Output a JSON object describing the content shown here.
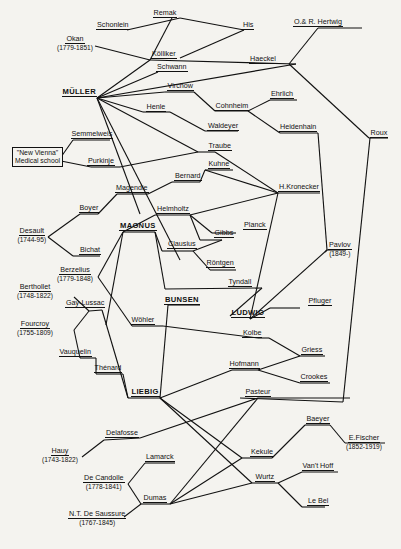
{
  "line_color": "#111111",
  "background": "#f4f3ef",
  "nodes": [
    {
      "id": "remak",
      "label": "Remak",
      "x": 165,
      "y": 16
    },
    {
      "id": "schonlein",
      "label": "Schonlein",
      "x": 113,
      "y": 28
    },
    {
      "id": "his",
      "label": "His",
      "x": 248,
      "y": 28
    },
    {
      "id": "hertwig",
      "label": "O.& R. Hertwig",
      "x": 318,
      "y": 25
    },
    {
      "id": "okan",
      "label": "Okan",
      "x": 75,
      "y": 42,
      "years": "(1779-1851)"
    },
    {
      "id": "kolliker",
      "label": "Kölliker",
      "x": 164,
      "y": 57
    },
    {
      "id": "haeckel",
      "label": "Haeckel",
      "x": 263,
      "y": 62
    },
    {
      "id": "schwann",
      "label": "Schwann",
      "x": 172,
      "y": 70
    },
    {
      "id": "muller",
      "label": "MÜLLER",
      "x": 79,
      "y": 95,
      "big": true
    },
    {
      "id": "virchow",
      "label": "Virchow",
      "x": 180,
      "y": 89
    },
    {
      "id": "ehrlich",
      "label": "Ehrlich",
      "x": 282,
      "y": 97
    },
    {
      "id": "cohnheim",
      "label": "Cohnheim",
      "x": 232,
      "y": 109
    },
    {
      "id": "henle",
      "label": "Henle",
      "x": 156,
      "y": 110
    },
    {
      "id": "waldeyer",
      "label": "Waldeyer",
      "x": 223,
      "y": 129
    },
    {
      "id": "heidenhain",
      "label": "Heidenhain",
      "x": 298,
      "y": 130
    },
    {
      "id": "roux",
      "label": "Roux",
      "x": 379,
      "y": 136
    },
    {
      "id": "semmelweis",
      "label": "Semmelweis",
      "x": 92,
      "y": 137
    },
    {
      "id": "traube",
      "label": "Traube",
      "x": 220,
      "y": 149
    },
    {
      "id": "purkinje",
      "label": "Purkinje",
      "x": 101,
      "y": 164
    },
    {
      "id": "kuhne",
      "label": "Kuhne",
      "x": 219,
      "y": 167
    },
    {
      "id": "bernard",
      "label": "Bernard",
      "x": 188,
      "y": 179
    },
    {
      "id": "magendie",
      "label": "Magendie",
      "x": 132,
      "y": 191
    },
    {
      "id": "kronecker",
      "label": "H.Kronecker",
      "x": 299,
      "y": 190
    },
    {
      "id": "boyer",
      "label": "Boyer",
      "x": 89,
      "y": 211
    },
    {
      "id": "helmholtz",
      "label": "Helmholtz",
      "x": 173,
      "y": 212
    },
    {
      "id": "planck",
      "label": "Planck",
      "x": 255,
      "y": 228
    },
    {
      "id": "magnus",
      "label": "MAGNUS",
      "x": 138,
      "y": 229,
      "big": true
    },
    {
      "id": "gibbs",
      "label": "Gibbs",
      "x": 224,
      "y": 236
    },
    {
      "id": "desault",
      "label": "Desault",
      "x": 32,
      "y": 234,
      "years": "(1744-95)"
    },
    {
      "id": "clausius",
      "label": "Clausius",
      "x": 182,
      "y": 247
    },
    {
      "id": "pavlov",
      "label": "Pavlov",
      "x": 340,
      "y": 248,
      "years": "(1849-)"
    },
    {
      "id": "bichat",
      "label": "Bichat",
      "x": 90,
      "y": 253
    },
    {
      "id": "rontgen",
      "label": "Röntgen",
      "x": 220,
      "y": 266
    },
    {
      "id": "berzelius",
      "label": "Berzelius",
      "x": 75,
      "y": 273,
      "years": "(1779-1848)"
    },
    {
      "id": "tyndall",
      "label": "Tyndall",
      "x": 240,
      "y": 285
    },
    {
      "id": "bertholet",
      "label": "Berthollet",
      "x": 35,
      "y": 290,
      "years": "(1748-1822)"
    },
    {
      "id": "bunsen",
      "label": "BUNSEN",
      "x": 182,
      "y": 303,
      "big": true
    },
    {
      "id": "gaylussac",
      "label": "Gay-Lussac",
      "x": 85,
      "y": 306
    },
    {
      "id": "pfluger",
      "label": "Pfluger",
      "x": 320,
      "y": 304
    },
    {
      "id": "ludwig",
      "label": "LUDWIG",
      "x": 248,
      "y": 316,
      "big": true
    },
    {
      "id": "fourcroy",
      "label": "Fourcroy",
      "x": 35,
      "y": 327,
      "years": "(1755-1809)"
    },
    {
      "id": "wohler",
      "label": "Wöhler",
      "x": 143,
      "y": 323
    },
    {
      "id": "kolbe",
      "label": "Kolbe",
      "x": 252,
      "y": 336
    },
    {
      "id": "vauquelin",
      "label": "Vauquelin",
      "x": 75,
      "y": 355
    },
    {
      "id": "griess",
      "label": "Griess",
      "x": 312,
      "y": 353
    },
    {
      "id": "hofmann",
      "label": "Hofmann",
      "x": 244,
      "y": 367
    },
    {
      "id": "thenard",
      "label": "Thénard",
      "x": 108,
      "y": 371
    },
    {
      "id": "crookes",
      "label": "Crookes",
      "x": 314,
      "y": 380
    },
    {
      "id": "liebig",
      "label": "LIEBIG",
      "x": 145,
      "y": 395,
      "big": true
    },
    {
      "id": "pasteur",
      "label": "Pasteur",
      "x": 258,
      "y": 395
    },
    {
      "id": "baeyer",
      "label": "Baeyer",
      "x": 318,
      "y": 422
    },
    {
      "id": "delafosse",
      "label": "Delafosse",
      "x": 122,
      "y": 436
    },
    {
      "id": "fischer",
      "label": "E.Fischer",
      "x": 364,
      "y": 441,
      "years": "(1852-1919)"
    },
    {
      "id": "hauy",
      "label": "Hauy",
      "x": 60,
      "y": 454,
      "years": "(1743-1822)"
    },
    {
      "id": "kekule",
      "label": "Kekule",
      "x": 262,
      "y": 455
    },
    {
      "id": "lamarck",
      "label": "Lamarck",
      "x": 160,
      "y": 460
    },
    {
      "id": "vanthoff",
      "label": "Van't Hoff",
      "x": 318,
      "y": 469
    },
    {
      "id": "decandolle",
      "label": "De Candolle",
      "x": 104,
      "y": 481,
      "years": "(1778-1841)"
    },
    {
      "id": "wurtz",
      "label": "Wurtz",
      "x": 265,
      "y": 480
    },
    {
      "id": "dumas",
      "label": "Dumas",
      "x": 155,
      "y": 501
    },
    {
      "id": "lebel",
      "label": "Le Bel",
      "x": 318,
      "y": 504
    },
    {
      "id": "saussure",
      "label": "N.T. De Saussure",
      "x": 97,
      "y": 517,
      "years": "(1767-1845)"
    }
  ],
  "box_node": {
    "label_line1": "\"New Vienna\"",
    "label_line2": "Medical school",
    "x": 12,
    "y": 147
  },
  "edges": [
    [
      127,
      30,
      180,
      18
    ],
    [
      180,
      18,
      244,
      30
    ],
    [
      244,
      30,
      180,
      58
    ],
    [
      95,
      46,
      150,
      60
    ],
    [
      150,
      60,
      172,
      18
    ],
    [
      150,
      60,
      296,
      64
    ],
    [
      97,
      98,
      150,
      60
    ],
    [
      97,
      98,
      158,
      72
    ],
    [
      97,
      98,
      296,
      64
    ],
    [
      97,
      98,
      165,
      92
    ],
    [
      97,
      98,
      143,
      112
    ],
    [
      97,
      98,
      198,
      152
    ],
    [
      97,
      98,
      180,
      260
    ],
    [
      97,
      98,
      140,
      214
    ],
    [
      165,
      92,
      194,
      92
    ],
    [
      194,
      92,
      215,
      111
    ],
    [
      215,
      111,
      248,
      111
    ],
    [
      248,
      111,
      270,
      100
    ],
    [
      270,
      100,
      297,
      100
    ],
    [
      248,
      111,
      280,
      133
    ],
    [
      280,
      133,
      318,
      133
    ],
    [
      143,
      112,
      170,
      112
    ],
    [
      170,
      112,
      205,
      131
    ],
    [
      205,
      131,
      238,
      131
    ],
    [
      289,
      64,
      318,
      28
    ],
    [
      318,
      28,
      362,
      28
    ],
    [
      289,
      64,
      369,
      138
    ],
    [
      369,
      138,
      388,
      138
    ],
    [
      370,
      138,
      343,
      402
    ],
    [
      343,
      402,
      240,
      398
    ],
    [
      318,
      133,
      327,
      250
    ],
    [
      327,
      250,
      325,
      252
    ],
    [
      61,
      157,
      73,
      140
    ],
    [
      73,
      140,
      110,
      140
    ],
    [
      61,
      161,
      91,
      167
    ],
    [
      91,
      167,
      120,
      167
    ],
    [
      120,
      167,
      198,
      152
    ],
    [
      198,
      152,
      215,
      152
    ],
    [
      215,
      152,
      278,
      193
    ],
    [
      278,
      193,
      320,
      193
    ],
    [
      205,
      170,
      278,
      193
    ],
    [
      205,
      170,
      233,
      170
    ],
    [
      205,
      170,
      200,
      182
    ],
    [
      200,
      182,
      172,
      182
    ],
    [
      172,
      182,
      148,
      194
    ],
    [
      148,
      194,
      117,
      194
    ],
    [
      117,
      194,
      98,
      214
    ],
    [
      98,
      214,
      80,
      214
    ],
    [
      80,
      214,
      48,
      237
    ],
    [
      48,
      237,
      73,
      256
    ],
    [
      73,
      256,
      100,
      256
    ],
    [
      155,
      215,
      190,
      215
    ],
    [
      190,
      215,
      278,
      193
    ],
    [
      155,
      215,
      123,
      232
    ],
    [
      123,
      232,
      155,
      232
    ],
    [
      190,
      215,
      212,
      233
    ],
    [
      212,
      233,
      236,
      233
    ],
    [
      190,
      215,
      200,
      240
    ],
    [
      200,
      240,
      222,
      240
    ],
    [
      222,
      240,
      193,
      251
    ],
    [
      193,
      251,
      162,
      251
    ],
    [
      193,
      251,
      210,
      270
    ],
    [
      210,
      270,
      236,
      270
    ],
    [
      278,
      193,
      250,
      319
    ],
    [
      250,
      319,
      270,
      308
    ],
    [
      270,
      308,
      300,
      308
    ],
    [
      250,
      319,
      327,
      250
    ],
    [
      327,
      250,
      346,
      250
    ],
    [
      155,
      232,
      162,
      251
    ],
    [
      155,
      232,
      165,
      289
    ],
    [
      165,
      289,
      262,
      288
    ],
    [
      262,
      288,
      230,
      316
    ],
    [
      123,
      232,
      98,
      277
    ],
    [
      123,
      232,
      106,
      325
    ],
    [
      98,
      277,
      132,
      326
    ],
    [
      132,
      326,
      163,
      326
    ],
    [
      163,
      326,
      258,
      338
    ],
    [
      258,
      338,
      269,
      338
    ],
    [
      269,
      338,
      300,
      356
    ],
    [
      300,
      356,
      325,
      356
    ],
    [
      89,
      311,
      102,
      310
    ],
    [
      102,
      310,
      128,
      398
    ],
    [
      128,
      398,
      160,
      398
    ],
    [
      74,
      297,
      89,
      311
    ],
    [
      74,
      330,
      89,
      311
    ],
    [
      74,
      330,
      80,
      358
    ],
    [
      80,
      358,
      96,
      358
    ],
    [
      96,
      358,
      96,
      374
    ],
    [
      96,
      374,
      123,
      374
    ],
    [
      123,
      374,
      128,
      398
    ],
    [
      160,
      398,
      168,
      305
    ],
    [
      168,
      305,
      200,
      305
    ],
    [
      160,
      398,
      232,
      370
    ],
    [
      232,
      370,
      258,
      370
    ],
    [
      258,
      370,
      300,
      356
    ],
    [
      258,
      370,
      300,
      383
    ],
    [
      300,
      383,
      330,
      383
    ],
    [
      160,
      398,
      242,
      458
    ],
    [
      242,
      458,
      272,
      458
    ],
    [
      272,
      458,
      305,
      425
    ],
    [
      305,
      425,
      330,
      425
    ],
    [
      330,
      425,
      345,
      443
    ],
    [
      345,
      443,
      385,
      443
    ],
    [
      160,
      398,
      252,
      483
    ],
    [
      140,
      438,
      258,
      398
    ],
    [
      258,
      398,
      350,
      398
    ],
    [
      82,
      457,
      104,
      440
    ],
    [
      104,
      440,
      140,
      438
    ],
    [
      128,
      484,
      145,
      463
    ],
    [
      145,
      463,
      175,
      463
    ],
    [
      128,
      484,
      141,
      504
    ],
    [
      141,
      504,
      170,
      504
    ],
    [
      124,
      517,
      141,
      504
    ],
    [
      170,
      504,
      258,
      398
    ],
    [
      170,
      504,
      242,
      458
    ],
    [
      170,
      504,
      252,
      483
    ],
    [
      252,
      483,
      278,
      483
    ],
    [
      278,
      483,
      302,
      472
    ],
    [
      302,
      472,
      338,
      472
    ],
    [
      278,
      483,
      302,
      507
    ],
    [
      302,
      507,
      325,
      507
    ]
  ]
}
